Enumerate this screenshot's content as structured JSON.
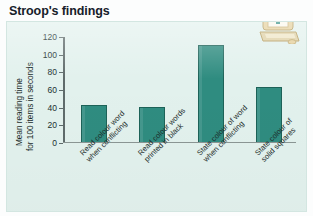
{
  "page": {
    "title": "Stroop's findings",
    "panel_bg": "#e2f1ed",
    "bar_color": "#2f8c80",
    "bar_outline": "#1d6258",
    "axis_color": "#5f6b6b"
  },
  "icons": {
    "computer": "computer-icon"
  },
  "chart_data": {
    "type": "bar",
    "title": "Stroop's findings",
    "xlabel": "",
    "ylabel": "Mean reading time for 100 items in seconds",
    "ylabel_lines": [
      "Mean reading time",
      "for 100 items in seconds"
    ],
    "categories": [
      "Read colour word when conflicting",
      "Read colour words printed in black",
      "State colour of word when conflicting",
      "State colour of solid squares"
    ],
    "category_lines": [
      [
        "Read colour word",
        "when conflicting"
      ],
      [
        "Read colour words",
        "printed in black"
      ],
      [
        "State colour of word",
        "when conflicting"
      ],
      [
        "State colour of",
        "solid squares"
      ]
    ],
    "values": [
      42,
      40,
      110,
      62
    ],
    "ylim": [
      0,
      120
    ],
    "yticks": [
      0,
      20,
      40,
      60,
      80,
      100,
      120
    ],
    "ytick_labels": [
      "0",
      "20",
      "40",
      "60",
      "80",
      "100",
      "120"
    ],
    "grid": false,
    "legend": null
  }
}
